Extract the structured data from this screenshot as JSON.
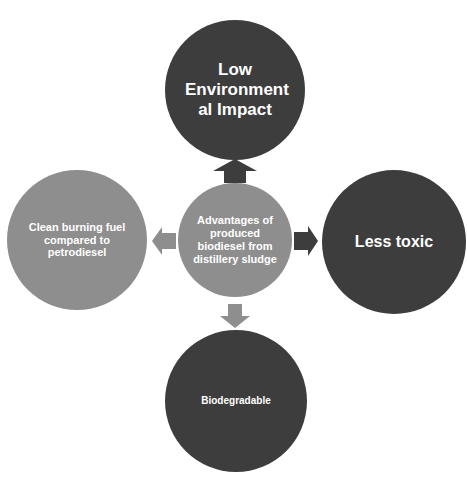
{
  "diagram": {
    "type": "radial-cycle",
    "center": {
      "label": "Advantages of produced biodiesel from distillery sludge",
      "color": "#8e8e8e"
    },
    "nodes": [
      {
        "position": "top",
        "label": "Low Environment al Impact",
        "color": "#3d3d3d",
        "arrow_color": "#3d3d3d"
      },
      {
        "position": "right",
        "label": "Less toxic",
        "color": "#3d3d3d",
        "arrow_color": "#3d3d3d"
      },
      {
        "position": "bottom",
        "label": "Biodegradable",
        "color": "#3d3d3d",
        "arrow_color": "#8e8e8e"
      },
      {
        "position": "left",
        "label": "Clean burning fuel compared to petrodiesel",
        "color": "#8e8e8e",
        "arrow_color": "#8e8e8e"
      }
    ],
    "arrows": [
      {
        "from": "center",
        "to": "top",
        "icon": "arrow-up-icon"
      },
      {
        "from": "center",
        "to": "right",
        "icon": "arrow-right-icon"
      },
      {
        "from": "center",
        "to": "bottom",
        "icon": "arrow-down-icon"
      },
      {
        "from": "center",
        "to": "left",
        "icon": "arrow-left-icon"
      }
    ]
  }
}
